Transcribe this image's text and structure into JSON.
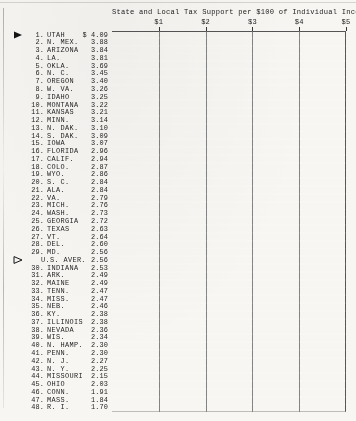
{
  "chart_data": {
    "type": "bar",
    "orientation": "horizontal",
    "title": "State and Local Tax Support per $100 of Individual Income",
    "xlabel": "",
    "ylabel": "",
    "xlim": [
      0,
      5
    ],
    "grid": true,
    "legend": null,
    "tick_labels": [
      "$1",
      "$2",
      "$3",
      "$4",
      "$5"
    ],
    "tick_values": [
      1,
      2,
      3,
      4,
      5
    ],
    "categories": [
      "UTAH",
      "N. MEX.",
      "ARIZONA",
      "LA.",
      "OKLA.",
      "N. C.",
      "OREGON",
      "W. VA.",
      "IDAHO",
      "MONTANA",
      "KANSAS",
      "MINN.",
      "N. DAK.",
      "S. DAK.",
      "IOWA",
      "FLORIDA",
      "CALIF.",
      "COLO.",
      "WYO.",
      "S. C.",
      "ALA.",
      "VA.",
      "MICH.",
      "WASH.",
      "GEORGIA",
      "TEXAS",
      "VT.",
      "DEL.",
      "MD.",
      "U.S. AVER.",
      "INDIANA",
      "ARK.",
      "MAINE",
      "TENN.",
      "MISS.",
      "NEB.",
      "KY.",
      "ILLINOIS",
      "NEVADA",
      "WIS.",
      "N. HAMP.",
      "PENN.",
      "N. J.",
      "N. Y.",
      "MISSOURI",
      "OHIO",
      "CONN.",
      "MASS.",
      "R. I."
    ],
    "values": [
      4.09,
      3.88,
      3.84,
      3.81,
      3.69,
      3.45,
      3.4,
      3.26,
      3.25,
      3.22,
      3.21,
      3.14,
      3.1,
      3.09,
      3.07,
      2.96,
      2.94,
      2.87,
      2.86,
      2.84,
      2.84,
      2.79,
      2.76,
      2.73,
      2.72,
      2.63,
      2.64,
      2.6,
      2.56,
      2.56,
      2.53,
      2.49,
      2.49,
      2.47,
      2.47,
      2.46,
      2.38,
      2.38,
      2.36,
      2.34,
      2.3,
      2.3,
      2.27,
      2.25,
      2.15,
      2.03,
      1.91,
      1.84,
      1.7
    ],
    "rows": [
      {
        "rank": "1.",
        "name": "UTAH",
        "value": 4.09,
        "value_label": "$ 4.09",
        "style": "checked",
        "marker": "solid-triangle-right"
      },
      {
        "rank": "2.",
        "name": "N. MEX.",
        "value": 3.88,
        "value_label": "3.88",
        "style": "solid",
        "marker": null
      },
      {
        "rank": "3.",
        "name": "ARIZONA",
        "value": 3.84,
        "value_label": "3.84",
        "style": "solid",
        "marker": null
      },
      {
        "rank": "4.",
        "name": "LA.",
        "value": 3.81,
        "value_label": "3.81",
        "style": "solid",
        "marker": null
      },
      {
        "rank": "5.",
        "name": "OKLA.",
        "value": 3.69,
        "value_label": "3.69",
        "style": "solid",
        "marker": null
      },
      {
        "rank": "6.",
        "name": "N. C.",
        "value": 3.45,
        "value_label": "3.45",
        "style": "solid",
        "marker": null
      },
      {
        "rank": "7.",
        "name": "OREGON",
        "value": 3.4,
        "value_label": "3.40",
        "style": "solid",
        "marker": null
      },
      {
        "rank": "8.",
        "name": "W. VA.",
        "value": 3.26,
        "value_label": "3.26",
        "style": "solid",
        "marker": null
      },
      {
        "rank": "9.",
        "name": "IDAHO",
        "value": 3.25,
        "value_label": "3.25",
        "style": "solid",
        "marker": null
      },
      {
        "rank": "10.",
        "name": "MONTANA",
        "value": 3.22,
        "value_label": "3.22",
        "style": "solid",
        "marker": null
      },
      {
        "rank": "11.",
        "name": "KANSAS",
        "value": 3.21,
        "value_label": "3.21",
        "style": "solid",
        "marker": null
      },
      {
        "rank": "12.",
        "name": "MINN.",
        "value": 3.14,
        "value_label": "3.14",
        "style": "solid",
        "marker": null
      },
      {
        "rank": "13.",
        "name": "N. DAK.",
        "value": 3.1,
        "value_label": "3.10",
        "style": "solid",
        "marker": null
      },
      {
        "rank": "14.",
        "name": "S. DAK.",
        "value": 3.09,
        "value_label": "3.09",
        "style": "solid",
        "marker": null
      },
      {
        "rank": "15.",
        "name": "IOWA",
        "value": 3.07,
        "value_label": "3.07",
        "style": "solid",
        "marker": null
      },
      {
        "rank": "16.",
        "name": "FLORIDA",
        "value": 2.96,
        "value_label": "2.96",
        "style": "solid",
        "marker": null
      },
      {
        "rank": "17.",
        "name": "CALIF.",
        "value": 2.94,
        "value_label": "2.94",
        "style": "solid",
        "marker": null
      },
      {
        "rank": "18.",
        "name": "COLO.",
        "value": 2.87,
        "value_label": "2.87",
        "style": "solid",
        "marker": null
      },
      {
        "rank": "19.",
        "name": "WYO.",
        "value": 2.86,
        "value_label": "2.86",
        "style": "solid",
        "marker": null
      },
      {
        "rank": "20.",
        "name": "S. C.",
        "value": 2.84,
        "value_label": "2.84",
        "style": "solid",
        "marker": null
      },
      {
        "rank": "21.",
        "name": "ALA.",
        "value": 2.84,
        "value_label": "2.84",
        "style": "solid",
        "marker": null
      },
      {
        "rank": "22.",
        "name": "VA.",
        "value": 2.79,
        "value_label": "2.79",
        "style": "solid",
        "marker": null
      },
      {
        "rank": "23.",
        "name": "MICH.",
        "value": 2.76,
        "value_label": "2.76",
        "style": "solid",
        "marker": null
      },
      {
        "rank": "24.",
        "name": "WASH.",
        "value": 2.73,
        "value_label": "2.73",
        "style": "solid",
        "marker": null
      },
      {
        "rank": "25.",
        "name": "GEORGIA",
        "value": 2.72,
        "value_label": "2.72",
        "style": "solid",
        "marker": null
      },
      {
        "rank": "26.",
        "name": "TEXAS",
        "value": 2.63,
        "value_label": "2.63",
        "style": "solid",
        "marker": null
      },
      {
        "rank": "27.",
        "name": "VT.",
        "value": 2.64,
        "value_label": "2.64",
        "style": "solid",
        "marker": null
      },
      {
        "rank": "28.",
        "name": "DEL.",
        "value": 2.6,
        "value_label": "2.60",
        "style": "solid",
        "marker": null
      },
      {
        "rank": "29.",
        "name": "MD.",
        "value": 2.56,
        "value_label": "2.56",
        "style": "solid",
        "marker": null
      },
      {
        "rank": "",
        "name": "U.S. AVER.",
        "value": 2.56,
        "value_label": "2.56",
        "style": "hollow",
        "marker": "hollow-triangle-right"
      },
      {
        "rank": "30.",
        "name": "INDIANA",
        "value": 2.53,
        "value_label": "2.53",
        "style": "solid",
        "marker": null
      },
      {
        "rank": "31.",
        "name": "ARK.",
        "value": 2.49,
        "value_label": "2.49",
        "style": "solid",
        "marker": null
      },
      {
        "rank": "32.",
        "name": "MAINE",
        "value": 2.49,
        "value_label": "2.49",
        "style": "solid",
        "marker": null
      },
      {
        "rank": "33.",
        "name": "TENN.",
        "value": 2.47,
        "value_label": "2.47",
        "style": "solid",
        "marker": null
      },
      {
        "rank": "34.",
        "name": "MISS.",
        "value": 2.47,
        "value_label": "2.47",
        "style": "solid",
        "marker": null
      },
      {
        "rank": "35.",
        "name": "NEB.",
        "value": 2.46,
        "value_label": "2.46",
        "style": "solid",
        "marker": null
      },
      {
        "rank": "36.",
        "name": "KY.",
        "value": 2.38,
        "value_label": "2.38",
        "style": "solid",
        "marker": null
      },
      {
        "rank": "37.",
        "name": "ILLINOIS",
        "value": 2.38,
        "value_label": "2.38",
        "style": "solid",
        "marker": null
      },
      {
        "rank": "38.",
        "name": "NEVADA",
        "value": 2.36,
        "value_label": "2.36",
        "style": "solid",
        "marker": null
      },
      {
        "rank": "39.",
        "name": "WIS.",
        "value": 2.34,
        "value_label": "2.34",
        "style": "solid",
        "marker": null
      },
      {
        "rank": "40.",
        "name": "N. HAMP.",
        "value": 2.3,
        "value_label": "2.30",
        "style": "solid",
        "marker": null
      },
      {
        "rank": "41.",
        "name": "PENN.",
        "value": 2.3,
        "value_label": "2.30",
        "style": "solid",
        "marker": null
      },
      {
        "rank": "42.",
        "name": "N. J.",
        "value": 2.27,
        "value_label": "2.27",
        "style": "solid",
        "marker": null
      },
      {
        "rank": "43.",
        "name": "N. Y.",
        "value": 2.25,
        "value_label": "2.25",
        "style": "solid",
        "marker": null
      },
      {
        "rank": "44.",
        "name": "MISSOURI",
        "value": 2.15,
        "value_label": "2.15",
        "style": "solid",
        "marker": null
      },
      {
        "rank": "45.",
        "name": "OHIO",
        "value": 2.03,
        "value_label": "2.03",
        "style": "solid",
        "marker": null
      },
      {
        "rank": "46.",
        "name": "CONN.",
        "value": 1.91,
        "value_label": "1.91",
        "style": "solid",
        "marker": null
      },
      {
        "rank": "47.",
        "name": "MASS.",
        "value": 1.84,
        "value_label": "1.84",
        "style": "solid",
        "marker": null
      },
      {
        "rank": "48.",
        "name": "R. I.",
        "value": 1.7,
        "value_label": "1.70",
        "style": "solid",
        "marker": null
      }
    ],
    "colors": {
      "bar": "#141414",
      "background": "#f7f6f3",
      "gridline": "#6d6d6d",
      "text": "#1f1f1f"
    }
  }
}
